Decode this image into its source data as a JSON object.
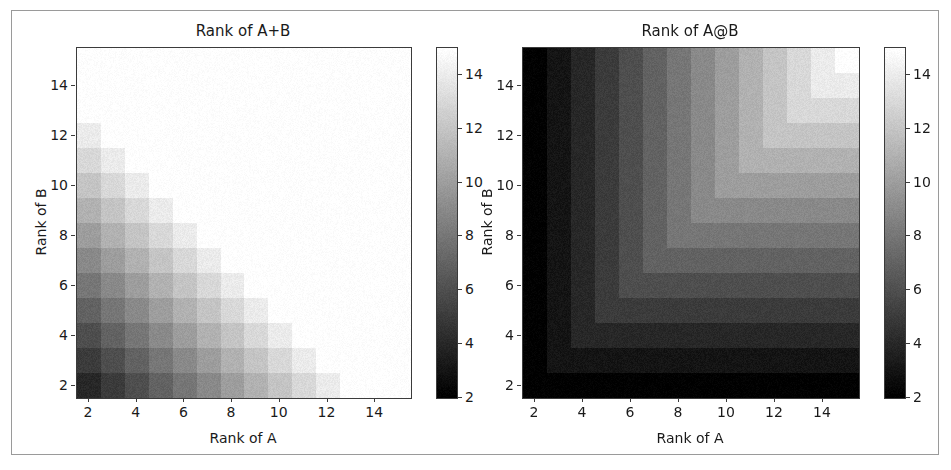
{
  "figure": {
    "width": 951,
    "height": 470,
    "background": "#ffffff",
    "frame_color": "#9a9a9a",
    "axis_color": "#3b3b3b",
    "text_color": "#1a1a1a",
    "colormap": "gray"
  },
  "chart_data": [
    {
      "type": "heatmap",
      "id": "rank-a-plus-b",
      "title": "Rank of A+B",
      "xlabel": "Rank of A",
      "ylabel": "Rank of B",
      "xlim": [
        1.5,
        15.5
      ],
      "ylim": [
        1.5,
        15.5
      ],
      "xticks": [
        2,
        4,
        6,
        8,
        10,
        12,
        14
      ],
      "yticks": [
        2,
        4,
        6,
        8,
        10,
        12,
        14
      ],
      "xtick_labels": [
        "2",
        "4",
        "6",
        "8",
        "10",
        "12",
        "14"
      ],
      "ytick_labels": [
        "2",
        "4",
        "6",
        "8",
        "10",
        "12",
        "14"
      ],
      "grid": false,
      "x_values": [
        2,
        3,
        4,
        5,
        6,
        7,
        8,
        9,
        10,
        11,
        12,
        13,
        14,
        15
      ],
      "y_values": [
        2,
        3,
        4,
        5,
        6,
        7,
        8,
        9,
        10,
        11,
        12,
        13,
        14,
        15
      ],
      "formula": "min(rank_A + rank_B, 15)",
      "vmin": 2,
      "vmax": 15,
      "noise": 0.55,
      "values": [
        [
          4,
          5,
          6,
          7,
          8,
          9,
          10,
          11,
          12,
          13,
          14,
          15,
          15,
          15
        ],
        [
          5,
          6,
          7,
          8,
          9,
          10,
          11,
          12,
          13,
          14,
          15,
          15,
          15,
          15
        ],
        [
          6,
          7,
          8,
          9,
          10,
          11,
          12,
          13,
          14,
          15,
          15,
          15,
          15,
          15
        ],
        [
          7,
          8,
          9,
          10,
          11,
          12,
          13,
          14,
          15,
          15,
          15,
          15,
          15,
          15
        ],
        [
          8,
          9,
          10,
          11,
          12,
          13,
          14,
          15,
          15,
          15,
          15,
          15,
          15,
          15
        ],
        [
          9,
          10,
          11,
          12,
          13,
          14,
          15,
          15,
          15,
          15,
          15,
          15,
          15,
          15
        ],
        [
          10,
          11,
          12,
          13,
          14,
          15,
          15,
          15,
          15,
          15,
          15,
          15,
          15,
          15
        ],
        [
          11,
          12,
          13,
          14,
          15,
          15,
          15,
          15,
          15,
          15,
          15,
          15,
          15,
          15
        ],
        [
          12,
          13,
          14,
          15,
          15,
          15,
          15,
          15,
          15,
          15,
          15,
          15,
          15,
          15
        ],
        [
          13,
          14,
          15,
          15,
          15,
          15,
          15,
          15,
          15,
          15,
          15,
          15,
          15,
          15
        ],
        [
          14,
          15,
          15,
          15,
          15,
          15,
          15,
          15,
          15,
          15,
          15,
          15,
          15,
          15
        ],
        [
          15,
          15,
          15,
          15,
          15,
          15,
          15,
          15,
          15,
          15,
          15,
          15,
          15,
          15
        ],
        [
          15,
          15,
          15,
          15,
          15,
          15,
          15,
          15,
          15,
          15,
          15,
          15,
          15,
          15
        ],
        [
          15,
          15,
          15,
          15,
          15,
          15,
          15,
          15,
          15,
          15,
          15,
          15,
          15,
          15
        ]
      ],
      "colorbar": {
        "vmin": 2,
        "vmax": 15,
        "ticks": [
          2,
          4,
          6,
          8,
          10,
          12,
          14
        ],
        "tick_labels": [
          "2",
          "4",
          "6",
          "8",
          "10",
          "12",
          "14"
        ],
        "orientation": "vertical"
      }
    },
    {
      "type": "heatmap",
      "id": "rank-a-at-b",
      "title": "Rank of A@B",
      "xlabel": "Rank of A",
      "ylabel": "Rank of B",
      "xlim": [
        1.5,
        15.5
      ],
      "ylim": [
        1.5,
        15.5
      ],
      "xticks": [
        2,
        4,
        6,
        8,
        10,
        12,
        14
      ],
      "yticks": [
        2,
        4,
        6,
        8,
        10,
        12,
        14
      ],
      "xtick_labels": [
        "2",
        "4",
        "6",
        "8",
        "10",
        "12",
        "14"
      ],
      "ytick_labels": [
        "2",
        "4",
        "6",
        "8",
        "10",
        "12",
        "14"
      ],
      "grid": false,
      "x_values": [
        2,
        3,
        4,
        5,
        6,
        7,
        8,
        9,
        10,
        11,
        12,
        13,
        14,
        15
      ],
      "y_values": [
        2,
        3,
        4,
        5,
        6,
        7,
        8,
        9,
        10,
        11,
        12,
        13,
        14,
        15
      ],
      "formula": "min(rank_A, rank_B)",
      "vmin": 2,
      "vmax": 15,
      "noise": 0.55,
      "values": [
        [
          2,
          2,
          2,
          2,
          2,
          2,
          2,
          2,
          2,
          2,
          2,
          2,
          2,
          2
        ],
        [
          2,
          3,
          3,
          3,
          3,
          3,
          3,
          3,
          3,
          3,
          3,
          3,
          3,
          3
        ],
        [
          2,
          3,
          4,
          4,
          4,
          4,
          4,
          4,
          4,
          4,
          4,
          4,
          4,
          4
        ],
        [
          2,
          3,
          4,
          5,
          5,
          5,
          5,
          5,
          5,
          5,
          5,
          5,
          5,
          5
        ],
        [
          2,
          3,
          4,
          5,
          6,
          6,
          6,
          6,
          6,
          6,
          6,
          6,
          6,
          6
        ],
        [
          2,
          3,
          4,
          5,
          6,
          7,
          7,
          7,
          7,
          7,
          7,
          7,
          7,
          7
        ],
        [
          2,
          3,
          4,
          5,
          6,
          7,
          8,
          8,
          8,
          8,
          8,
          8,
          8,
          8
        ],
        [
          2,
          3,
          4,
          5,
          6,
          7,
          8,
          9,
          9,
          9,
          9,
          9,
          9,
          9
        ],
        [
          2,
          3,
          4,
          5,
          6,
          7,
          8,
          9,
          10,
          10,
          10,
          10,
          10,
          10
        ],
        [
          2,
          3,
          4,
          5,
          6,
          7,
          8,
          9,
          10,
          11,
          11,
          11,
          11,
          11
        ],
        [
          2,
          3,
          4,
          5,
          6,
          7,
          8,
          9,
          10,
          11,
          12,
          12,
          12,
          12
        ],
        [
          2,
          3,
          4,
          5,
          6,
          7,
          8,
          9,
          10,
          11,
          12,
          13,
          13,
          13
        ],
        [
          2,
          3,
          4,
          5,
          6,
          7,
          8,
          9,
          10,
          11,
          12,
          13,
          14,
          14
        ],
        [
          2,
          3,
          4,
          5,
          6,
          7,
          8,
          9,
          10,
          11,
          12,
          13,
          14,
          15
        ]
      ],
      "colorbar": {
        "vmin": 2,
        "vmax": 15,
        "ticks": [
          2,
          4,
          6,
          8,
          10,
          12,
          14
        ],
        "tick_labels": [
          "2",
          "4",
          "6",
          "8",
          "10",
          "12",
          "14"
        ],
        "orientation": "vertical"
      }
    }
  ],
  "layout": {
    "panels": [
      {
        "axes": {
          "left": 76,
          "top": 47,
          "width": 334,
          "height": 350
        },
        "colorbar": {
          "left": 436,
          "top": 47,
          "width": 20,
          "height": 350
        },
        "title_center": 243,
        "title_top": 22,
        "xlabel_center": 243,
        "xlabel_top": 430,
        "ylabel_left": 33,
        "ylabel_center_y": 222
      },
      {
        "axes": {
          "left": 522,
          "top": 47,
          "width": 336,
          "height": 350
        },
        "colorbar": {
          "left": 884,
          "top": 47,
          "width": 20,
          "height": 350
        },
        "title_center": 690,
        "title_top": 22,
        "xlabel_center": 690,
        "xlabel_top": 430,
        "ylabel_left": 479,
        "ylabel_center_y": 222
      }
    ]
  }
}
